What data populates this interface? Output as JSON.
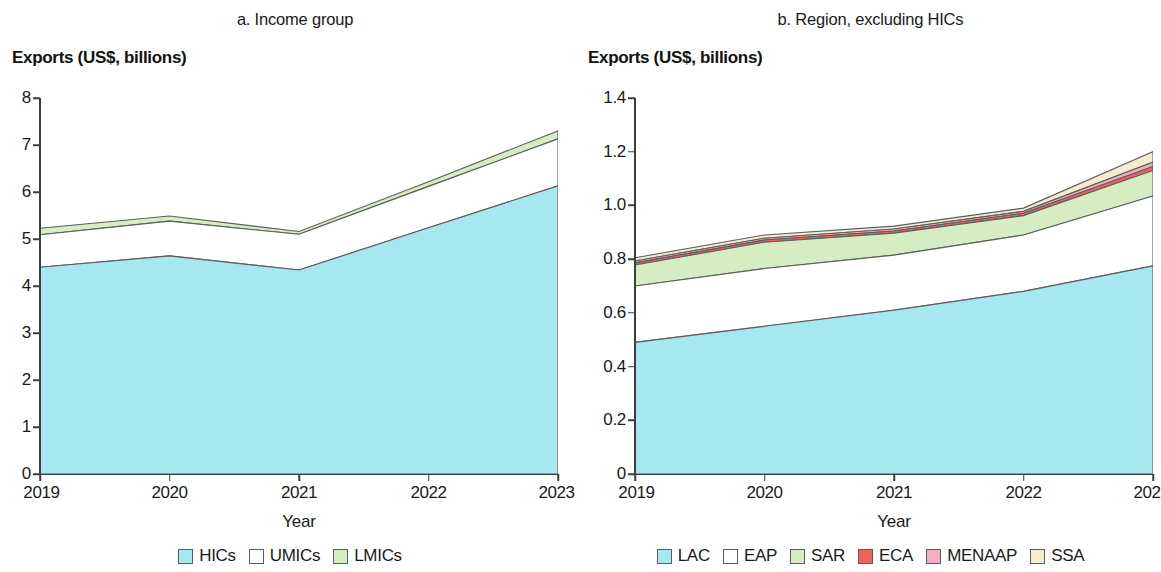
{
  "panels": {
    "a": {
      "title": "a. Income group",
      "y_axis_title": "Exports (US$, billions)",
      "x_axis_title": "Year"
    },
    "b": {
      "title": "b. Region, excluding HICs",
      "y_axis_title": "Exports (US$, billions)",
      "x_axis_title": "Year"
    }
  },
  "colors": {
    "HICs": "#A6E7F0",
    "UMICs": "#FFFFFF",
    "LMICs": "#D6EDC4",
    "LAC": "#A6E7F0",
    "EAP": "#FFFFFF",
    "SAR": "#D6EDC4",
    "ECA": "#F0625C",
    "MENAAP": "#F3AFC0",
    "SSA": "#F5EBCF",
    "outline": "#5e5e5e",
    "axis": "#3d3d3d",
    "text": "#1a1a1a"
  },
  "chart_data": [
    {
      "type": "area",
      "id": "panel-a",
      "title": "a. Income group",
      "stacked": true,
      "xlabel": "Year",
      "ylabel": "Exports (US$, billions)",
      "x": [
        2019,
        2020,
        2021,
        2022,
        2023
      ],
      "xticklabels": [
        "2019",
        "2020",
        "2021",
        "2022",
        "2023"
      ],
      "yticklabels": [
        "0",
        "1",
        "2",
        "3",
        "4",
        "5",
        "6",
        "7",
        "8"
      ],
      "yticks": [
        0,
        1,
        2,
        3,
        4,
        5,
        6,
        7,
        8
      ],
      "ylim": [
        0,
        8
      ],
      "grid": false,
      "legend_position": "bottom",
      "series": [
        {
          "name": "HICs",
          "values": [
            4.4,
            4.64,
            4.34,
            5.24,
            6.13
          ]
        },
        {
          "name": "UMICs",
          "values": [
            0.69,
            0.74,
            0.76,
            0.88,
            1.0
          ]
        },
        {
          "name": "LMICs",
          "values": [
            0.14,
            0.11,
            0.06,
            0.1,
            0.17
          ]
        }
      ],
      "cumulative_tops": {
        "HICs": [
          4.4,
          4.64,
          4.34,
          5.24,
          6.13
        ],
        "UMICs": [
          5.09,
          5.38,
          5.1,
          6.12,
          7.13
        ],
        "LMICs": [
          5.23,
          5.49,
          5.16,
          6.22,
          7.3
        ]
      }
    },
    {
      "type": "area",
      "id": "panel-b",
      "title": "b. Region, excluding HICs",
      "stacked": true,
      "xlabel": "Year",
      "ylabel": "Exports (US$, billions)",
      "x": [
        2019,
        2020,
        2021,
        2022,
        2023
      ],
      "xticklabels": [
        "2019",
        "2020",
        "2021",
        "2022",
        "2023"
      ],
      "yticklabels": [
        "0",
        "0.2",
        "0.4",
        "0.6",
        "0.8",
        "1.0",
        "1.2",
        "1.4"
      ],
      "yticks": [
        0,
        0.2,
        0.4,
        0.6,
        0.8,
        1.0,
        1.2,
        1.4
      ],
      "ylim": [
        0,
        1.4
      ],
      "grid": false,
      "legend_position": "bottom",
      "series": [
        {
          "name": "LAC",
          "values": [
            0.49,
            0.55,
            0.61,
            0.68,
            0.775
          ]
        },
        {
          "name": "EAP",
          "values": [
            0.21,
            0.215,
            0.205,
            0.21,
            0.26
          ]
        },
        {
          "name": "SAR",
          "values": [
            0.078,
            0.098,
            0.082,
            0.072,
            0.095
          ]
        },
        {
          "name": "ECA",
          "values": [
            0.008,
            0.008,
            0.008,
            0.009,
            0.015
          ]
        },
        {
          "name": "MENAAP",
          "values": [
            0.007,
            0.007,
            0.007,
            0.007,
            0.016
          ]
        },
        {
          "name": "SSA",
          "values": [
            0.012,
            0.012,
            0.011,
            0.012,
            0.039
          ]
        }
      ],
      "cumulative_tops": {
        "LAC": [
          0.49,
          0.55,
          0.61,
          0.68,
          0.775
        ],
        "EAP": [
          0.7,
          0.765,
          0.815,
          0.89,
          1.035
        ],
        "SAR": [
          0.778,
          0.863,
          0.897,
          0.962,
          1.13
        ],
        "ECA": [
          0.786,
          0.871,
          0.905,
          0.971,
          1.145
        ],
        "MENAAP": [
          0.793,
          0.878,
          0.912,
          0.978,
          1.161
        ],
        "SSA": [
          0.805,
          0.89,
          0.923,
          0.99,
          1.2
        ]
      }
    }
  ],
  "legends": {
    "a": [
      {
        "label": "HICs",
        "color_key": "HICs"
      },
      {
        "label": "UMICs",
        "color_key": "UMICs"
      },
      {
        "label": "LMICs",
        "color_key": "LMICs"
      }
    ],
    "b": [
      {
        "label": "LAC",
        "color_key": "LAC"
      },
      {
        "label": "EAP",
        "color_key": "EAP"
      },
      {
        "label": "SAR",
        "color_key": "SAR"
      },
      {
        "label": "ECA",
        "color_key": "ECA"
      },
      {
        "label": "MENAAP",
        "color_key": "MENAAP"
      },
      {
        "label": "SSA",
        "color_key": "SSA"
      }
    ]
  }
}
